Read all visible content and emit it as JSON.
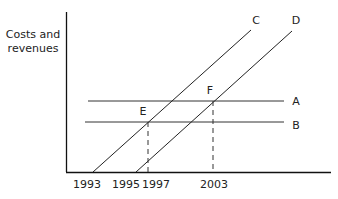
{
  "diagram": {
    "y_axis_label_line1": "Costs and",
    "y_axis_label_line2": "revenues",
    "x_ticks": [
      {
        "label": "1993",
        "x": 85
      },
      {
        "label": "1995",
        "x": 126
      },
      {
        "label": "1997",
        "x": 148
      },
      {
        "label": "2003",
        "x": 213
      }
    ],
    "lines": [
      {
        "label": "A",
        "kind": "horizontal"
      },
      {
        "label": "B",
        "kind": "horizontal"
      },
      {
        "label": "C",
        "kind": "upward-sloping"
      },
      {
        "label": "D",
        "kind": "upward-sloping"
      }
    ],
    "points": [
      {
        "label": "E",
        "year": "1997"
      },
      {
        "label": "F",
        "year": "2003"
      }
    ]
  }
}
